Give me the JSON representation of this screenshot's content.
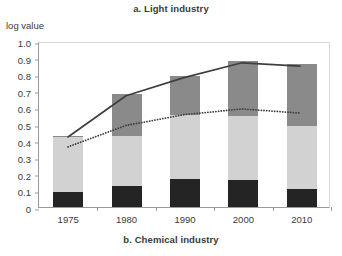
{
  "chart_data": {
    "type": "bar",
    "title": "a. Light industry",
    "bottom_caption": "b. Chemical industry",
    "ylabel": "log value",
    "xlabel": "",
    "ylim": [
      0,
      1.0
    ],
    "ytick_labels": [
      "1.0",
      "0.9",
      "0.8",
      "0.7",
      "0.6",
      "0.5",
      "0.4",
      "0.3",
      "0.2",
      "0.1",
      "0"
    ],
    "ytick_values": [
      1.0,
      0.9,
      0.8,
      0.7,
      0.6,
      0.5,
      0.4,
      0.3,
      0.2,
      0.1,
      0
    ],
    "categories": [
      "1975",
      "1980",
      "1990",
      "2000",
      "2010"
    ],
    "grid": false,
    "legend": "none",
    "stacked": true,
    "series": [
      {
        "name": "bottom-segment",
        "color": "#242424",
        "values": [
          0.09,
          0.125,
          0.17,
          0.16,
          0.11
        ]
      },
      {
        "name": "middle-segment",
        "color": "#d2d2d2",
        "values": [
          0.33,
          0.305,
          0.385,
          0.39,
          0.38
        ]
      },
      {
        "name": "top-segment",
        "color": "#8a8a8a",
        "values": [
          0.01,
          0.25,
          0.235,
          0.33,
          0.37
        ]
      }
    ],
    "bar_totals": [
      0.43,
      0.68,
      0.79,
      0.88,
      0.86
    ],
    "overlays": [
      {
        "name": "solid-line",
        "style": "solid",
        "color": "#3f3f3f",
        "values": [
          0.43,
          0.68,
          0.79,
          0.88,
          0.86
        ]
      },
      {
        "name": "dotted-line",
        "style": "dotted",
        "color": "#3f3f3f",
        "values": [
          0.37,
          0.5,
          0.565,
          0.6,
          0.575
        ]
      }
    ]
  }
}
